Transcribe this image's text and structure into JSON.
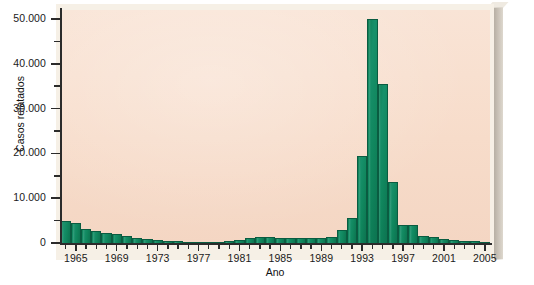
{
  "chart_data": {
    "type": "bar",
    "title": "",
    "xlabel": "Ano",
    "ylabel": "Casos relatados",
    "xlim": [
      1963.5,
      2005.5
    ],
    "ylim": [
      0,
      52000
    ],
    "grid": false,
    "legend": null,
    "bar_color": "#117f5b",
    "plot_background_color": "#f7dcca",
    "y_ticks_major": [
      "0",
      "10.000",
      "20.000",
      "30.000",
      "40.000",
      "50.000"
    ],
    "y_tick_major_values": [
      0,
      10000,
      20000,
      30000,
      40000,
      50000
    ],
    "y_tick_minor_values": [
      5000,
      15000,
      25000,
      35000,
      45000
    ],
    "x_ticks_labeled": [
      "1965",
      "1969",
      "1973",
      "1977",
      "1981",
      "1985",
      "1989",
      "1993",
      "1997",
      "2001",
      "2005"
    ],
    "x_tick_labeled_values": [
      1965,
      1969,
      1973,
      1977,
      1981,
      1985,
      1989,
      1993,
      1997,
      2001,
      2005
    ],
    "categories": [
      1964,
      1965,
      1966,
      1967,
      1968,
      1969,
      1970,
      1971,
      1972,
      1973,
      1974,
      1975,
      1976,
      1977,
      1978,
      1979,
      1980,
      1981,
      1982,
      1983,
      1984,
      1985,
      1986,
      1987,
      1988,
      1989,
      1990,
      1991,
      1992,
      1993,
      1994,
      1995,
      1996,
      1997,
      1998,
      1999,
      2000,
      2001,
      2002,
      2003,
      2004,
      2005
    ],
    "values": [
      4800,
      4500,
      3100,
      2600,
      2200,
      2000,
      1500,
      1100,
      900,
      600,
      450,
      350,
      300,
      250,
      250,
      300,
      350,
      600,
      1100,
      1300,
      1300,
      1200,
      1100,
      1100,
      1100,
      1200,
      1300,
      2900,
      5600,
      19500,
      50000,
      35500,
      13700,
      4000,
      4000,
      1600,
      1300,
      1000,
      700,
      500,
      400,
      300
    ]
  },
  "axes": {
    "y_title": "Casos relatados",
    "x_title": "Ano"
  }
}
